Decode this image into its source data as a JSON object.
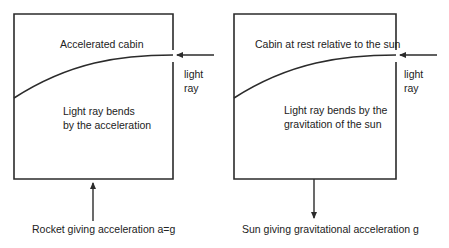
{
  "left_panel": {
    "cabin_label": "Accelerated cabin",
    "ray_label_line1": "light",
    "ray_label_line2": "ray",
    "bend_line1": "Light ray bends",
    "bend_line2": "by the acceleration",
    "force_label": "Rocket giving acceleration a=g",
    "force_direction": "up"
  },
  "right_panel": {
    "cabin_label": "Cabin at rest relative to the sun",
    "ray_label_line1": "light",
    "ray_label_line2": "ray",
    "bend_line1": "Light ray bends by the",
    "bend_line2": "gravitation of the sun",
    "force_label": "Sun giving gravitational acceleration g",
    "force_direction": "down"
  },
  "colors": {
    "stroke": "#2b2b2b",
    "background": "#ffffff"
  }
}
